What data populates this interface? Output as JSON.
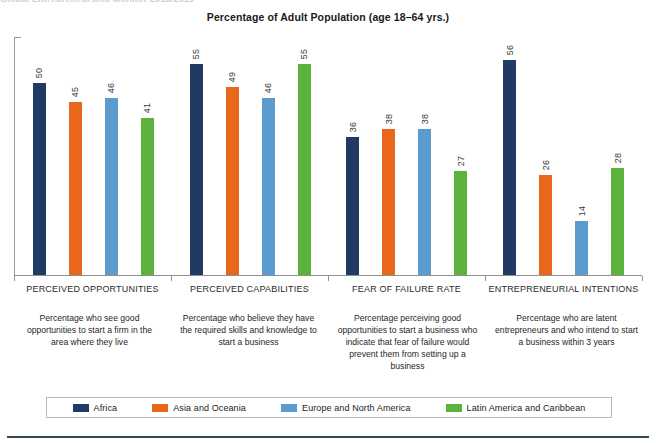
{
  "top_remnant": "Global Entrepreneurship Monitor 2018/2019",
  "chart_data": {
    "type": "bar",
    "title": "Percentage of Adult Population (age 18–64 yrs.)",
    "xlabel": "",
    "ylabel": "",
    "ylim": [
      0,
      62
    ],
    "grid": false,
    "legend_position": "bottom",
    "categories": [
      "PERCEIVED OPPORTUNITIES",
      "PERCEIVED CAPABILITIES",
      "FEAR OF FAILURE RATE",
      "ENTREPRENEURIAL INTENTIONS"
    ],
    "category_descriptions": [
      "Percentage who see good opportunities to start a firm in the area where they live",
      "Percentage who believe they have the required skills and knowledge to start a business",
      "Percentage perceiving good opportunities to start a business who indicate that fear of failure would prevent them from setting up a business",
      "Percentage who are latent entrepreneurs and who intend to start a business within 3 years"
    ],
    "series": [
      {
        "name": "Africa",
        "color": "#1F3B63",
        "values": [
          50,
          55,
          36,
          56
        ]
      },
      {
        "name": "Asia and Oceania",
        "color": "#E8671C",
        "values": [
          45,
          49,
          38,
          26
        ]
      },
      {
        "name": "Europe and North America",
        "color": "#5B9BCE",
        "values": [
          46,
          46,
          38,
          14
        ]
      },
      {
        "name": "Latin America and Caribbean",
        "color": "#5CB33B",
        "values": [
          41,
          55,
          27,
          28
        ]
      }
    ]
  }
}
